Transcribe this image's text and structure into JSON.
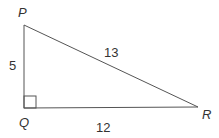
{
  "diagram": {
    "type": "right-triangle",
    "vertices": {
      "P": "P",
      "Q": "Q",
      "R": "R"
    },
    "sides": {
      "PQ": "5",
      "PR": "13",
      "QR": "12"
    },
    "right_angle_at": "Q",
    "line_color": "#555555"
  }
}
